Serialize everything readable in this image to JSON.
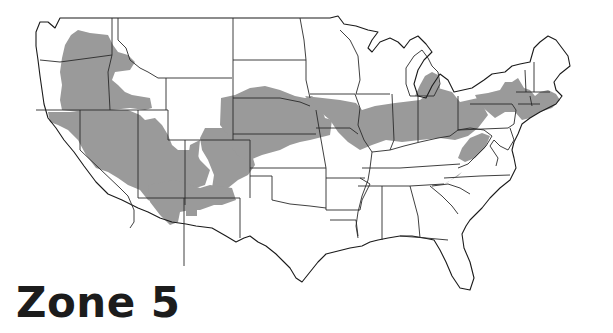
{
  "title": "Zone 5",
  "map": {
    "type": "usa-hardiness-zone-map",
    "highlighted_zone": "5",
    "colors": {
      "zone_fill": "#9a9a9a",
      "state_border": "#2a2a2a",
      "background": "#ffffff",
      "title_text": "#1c1c1c"
    },
    "legend": [
      {
        "label": "Zone 5",
        "color": "#9a9a9a"
      }
    ]
  }
}
